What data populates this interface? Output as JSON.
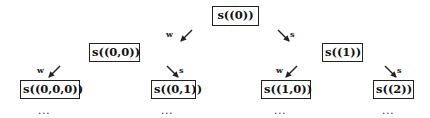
{
  "diagram": {
    "type": "tree-fragment",
    "nodes": [
      {
        "id": "n0",
        "label": "s((0))",
        "x": 212,
        "y": 6,
        "w": 47,
        "h": 20
      },
      {
        "id": "n00",
        "label": "s((0,0))",
        "x": 89,
        "y": 43,
        "w": 51,
        "h": 19
      },
      {
        "id": "n1",
        "label": "s((1))",
        "x": 322,
        "y": 43,
        "w": 41,
        "h": 19
      },
      {
        "id": "n000",
        "label": "s((0,0,0))",
        "x": 20,
        "y": 80,
        "w": 60,
        "h": 19
      },
      {
        "id": "n01",
        "label": "s((0,1))",
        "x": 151,
        "y": 80,
        "w": 45,
        "h": 19
      },
      {
        "id": "n10",
        "label": "s((1,0))",
        "x": 261,
        "y": 80,
        "w": 50,
        "h": 19
      },
      {
        "id": "n2",
        "label": "s((2))",
        "x": 373,
        "y": 80,
        "w": 41,
        "h": 19
      }
    ],
    "edges": [
      {
        "id": "e_n0_w",
        "label": "w",
        "direction": "down-left",
        "label_x": 166,
        "label_y": 30,
        "x1": 192,
        "y1": 30,
        "x2": 181,
        "y2": 41
      },
      {
        "id": "e_n0_s",
        "label": "s",
        "direction": "down-right",
        "label_x": 290,
        "label_y": 30,
        "x1": 278,
        "y1": 30,
        "x2": 289,
        "y2": 41
      },
      {
        "id": "e_n00_w",
        "label": "w",
        "direction": "down-left",
        "label_x": 37,
        "label_y": 66,
        "x1": 60,
        "y1": 66,
        "x2": 49,
        "y2": 77
      },
      {
        "id": "e_n00_s",
        "label": "s",
        "direction": "down-right",
        "label_x": 179,
        "label_y": 66,
        "x1": 167,
        "y1": 66,
        "x2": 178,
        "y2": 77
      },
      {
        "id": "e_n1_w",
        "label": "w",
        "direction": "down-left",
        "label_x": 276,
        "label_y": 66,
        "x1": 297,
        "y1": 66,
        "x2": 286,
        "y2": 77
      },
      {
        "id": "e_n1_s",
        "label": "s",
        "direction": "down-right",
        "label_x": 397,
        "label_y": 66,
        "x1": 385,
        "y1": 66,
        "x2": 396,
        "y2": 77
      }
    ],
    "continuations": [
      {
        "id": "c_n000",
        "text": "...",
        "x": 38,
        "y": 106
      },
      {
        "id": "c_n01",
        "text": "...",
        "x": 161,
        "y": 106
      },
      {
        "id": "c_n10",
        "text": "...",
        "x": 274,
        "y": 106
      },
      {
        "id": "c_n2",
        "text": "...",
        "x": 382,
        "y": 106
      }
    ],
    "colors": {
      "stroke": "#222222",
      "background": "#ffffff",
      "text": "#111111"
    }
  }
}
